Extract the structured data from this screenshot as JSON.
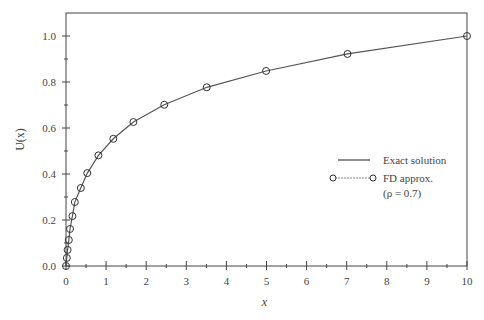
{
  "chart_data": {
    "type": "line",
    "title": "",
    "xlabel": "x",
    "ylabel": "U(x)",
    "xlim": [
      0,
      10
    ],
    "ylim": [
      0,
      1.1
    ],
    "x_ticks": [
      "0",
      "1",
      "2",
      "3",
      "4",
      "5",
      "6",
      "7",
      "8",
      "9",
      "10"
    ],
    "y_ticks": [
      "0.0",
      "0.2",
      "0.4",
      "0.6",
      "0.8",
      "1.0"
    ],
    "grid": false,
    "legend_position": "center-right",
    "series": [
      {
        "name": "Exact solution",
        "style": "solid line",
        "x": [
          0,
          0.02,
          0.05,
          0.1,
          0.2,
          0.4,
          0.8,
          1.2,
          1.7,
          2.4,
          3.5,
          5,
          7,
          10
        ],
        "values": [
          0,
          0.035,
          0.07,
          0.13,
          0.26,
          0.34,
          0.48,
          0.553,
          0.626,
          0.701,
          0.777,
          0.848,
          0.922,
          1.0
        ]
      },
      {
        "name": "FD approx. (ρ = 0.7)",
        "style": "circle markers with line",
        "x": [
          0,
          0.02,
          0.04,
          0.07,
          0.1,
          0.16,
          0.22,
          0.37,
          0.53,
          0.81,
          1.18,
          1.68,
          2.45,
          3.51,
          4.99,
          7.02,
          10.0
        ],
        "values": [
          0.0,
          0.035,
          0.07,
          0.113,
          0.161,
          0.217,
          0.278,
          0.339,
          0.404,
          0.481,
          0.553,
          0.626,
          0.701,
          0.777,
          0.848,
          0.922,
          1.0
        ]
      }
    ]
  },
  "legend": {
    "exact_label": "Exact solution",
    "fd_label": "FD approx.",
    "fd_param": "(ρ = 0.7)"
  },
  "axes": {
    "xlabel": "x",
    "ylabel": "U(x)"
  }
}
